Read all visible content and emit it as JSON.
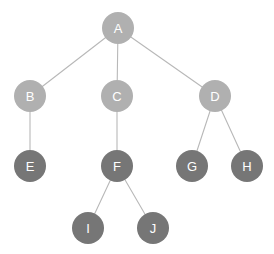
{
  "diagram": {
    "type": "node-link-tree",
    "background_color": "#ffffff",
    "canvas": {
      "width": 274,
      "height": 254
    },
    "node_radius": 16,
    "edge_color": "#b8b8b8",
    "label_color": "#ffffff",
    "palette": {
      "light_node": "#b0b0b0",
      "dark_node": "#767676"
    },
    "nodes": [
      {
        "id": "A",
        "label": "A",
        "cx": 118,
        "cy": 28,
        "r": 16,
        "fill": "#b0b0b0",
        "level": 0
      },
      {
        "id": "B",
        "label": "B",
        "cx": 30,
        "cy": 96,
        "r": 16,
        "fill": "#b0b0b0",
        "level": 1
      },
      {
        "id": "C",
        "label": "C",
        "cx": 117,
        "cy": 96,
        "r": 16,
        "fill": "#b0b0b0",
        "level": 1
      },
      {
        "id": "D",
        "label": "D",
        "cx": 215,
        "cy": 96,
        "r": 16,
        "fill": "#b0b0b0",
        "level": 1
      },
      {
        "id": "E",
        "label": "E",
        "cx": 30,
        "cy": 166,
        "r": 16,
        "fill": "#767676",
        "level": 2
      },
      {
        "id": "F",
        "label": "F",
        "cx": 117,
        "cy": 166,
        "r": 16,
        "fill": "#767676",
        "level": 2
      },
      {
        "id": "G",
        "label": "G",
        "cx": 192,
        "cy": 166,
        "r": 16,
        "fill": "#767676",
        "level": 2
      },
      {
        "id": "H",
        "label": "H",
        "cx": 247,
        "cy": 166,
        "r": 16,
        "fill": "#767676",
        "level": 2
      },
      {
        "id": "I",
        "label": "I",
        "cx": 88,
        "cy": 228,
        "r": 16,
        "fill": "#767676",
        "level": 3
      },
      {
        "id": "J",
        "label": "J",
        "cx": 153,
        "cy": 228,
        "r": 16,
        "fill": "#767676",
        "level": 3
      }
    ],
    "edges": [
      {
        "from": "A",
        "to": "B",
        "x1": 118,
        "y1": 28,
        "x2": 30,
        "y2": 96
      },
      {
        "from": "A",
        "to": "C",
        "x1": 118,
        "y1": 28,
        "x2": 117,
        "y2": 96
      },
      {
        "from": "A",
        "to": "D",
        "x1": 118,
        "y1": 28,
        "x2": 215,
        "y2": 96
      },
      {
        "from": "B",
        "to": "E",
        "x1": 30,
        "y1": 96,
        "x2": 30,
        "y2": 166
      },
      {
        "from": "C",
        "to": "F",
        "x1": 117,
        "y1": 96,
        "x2": 117,
        "y2": 166
      },
      {
        "from": "D",
        "to": "G",
        "x1": 215,
        "y1": 96,
        "x2": 192,
        "y2": 166
      },
      {
        "from": "D",
        "to": "H",
        "x1": 215,
        "y1": 96,
        "x2": 247,
        "y2": 166
      },
      {
        "from": "F",
        "to": "I",
        "x1": 117,
        "y1": 166,
        "x2": 88,
        "y2": 228
      },
      {
        "from": "F",
        "to": "J",
        "x1": 117,
        "y1": 166,
        "x2": 153,
        "y2": 228
      }
    ]
  }
}
